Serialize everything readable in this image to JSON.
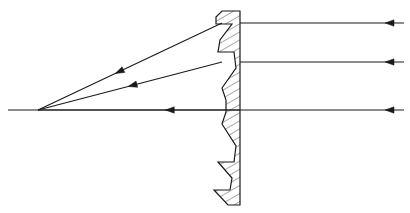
{
  "figure": {
    "kind": "optical-ray-diagram",
    "width": 410,
    "height": 213,
    "background_color": "#ffffff",
    "line_color": "#1a1a1a",
    "hatch_color": "#1a1a1a",
    "stroke_width": 1.1
  },
  "optical_axis": {
    "label": "optical axis",
    "x_start": 8,
    "x_end": 240,
    "y": 110
  },
  "focal_point": {
    "label": "focal point",
    "x": 38,
    "y": 110
  },
  "lens": {
    "label": "Fresnel lens",
    "flat_face_x": 240,
    "apex_top": {
      "x": 222,
      "y": 11
    },
    "apex_bottom": {
      "x": 228,
      "y": 205
    },
    "groove_count_top": 2,
    "groove_count_bottom": 2,
    "profile_points": [
      [
        222,
        11
      ],
      [
        240,
        11
      ],
      [
        240,
        205
      ],
      [
        228,
        205
      ],
      [
        214,
        190
      ],
      [
        230,
        190
      ],
      [
        232,
        178
      ],
      [
        218,
        162
      ],
      [
        234,
        162
      ],
      [
        236,
        146
      ],
      [
        222,
        124
      ],
      [
        226,
        112
      ],
      [
        226,
        100
      ],
      [
        222,
        88
      ],
      [
        236,
        68
      ],
      [
        234,
        52
      ],
      [
        218,
        52
      ],
      [
        220,
        40
      ],
      [
        232,
        24
      ],
      [
        216,
        24
      ],
      [
        216,
        17
      ]
    ],
    "hatch_angle_deg": 60,
    "hatch_spacing": 7
  },
  "incoming_rays": {
    "label": "incoming parallel rays",
    "direction": "right-to-left",
    "x_start": 404,
    "x_end": 240,
    "arrow_x": 385,
    "rays": [
      {
        "name": "ray-top",
        "y": 23
      },
      {
        "name": "ray-middle",
        "y": 62
      },
      {
        "name": "ray-axis",
        "y": 110
      }
    ]
  },
  "refracted_rays": {
    "label": "refracted converging rays",
    "direction": "right-to-left",
    "rays": [
      {
        "name": "refracted-ray-top",
        "x1": 222,
        "y1": 23,
        "x2": 38,
        "y2": 110,
        "arrow_t": 0.58
      },
      {
        "name": "refracted-ray-middle",
        "x1": 222,
        "y1": 62,
        "x2": 38,
        "y2": 110,
        "arrow_t": 0.51
      },
      {
        "name": "refracted-ray-axis",
        "x1": 240,
        "y1": 110,
        "x2": 38,
        "y2": 110,
        "arrow_t": 0.37
      }
    ]
  }
}
